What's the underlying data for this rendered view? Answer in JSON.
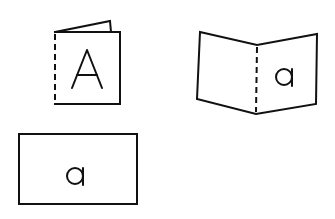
{
  "diagram": {
    "stroke_color": "#111111",
    "background_color": "#ffffff",
    "figures": [
      {
        "id": "closed-booklet",
        "label": "A",
        "fold": "dashed left spine, back page peeking above top edge"
      },
      {
        "id": "open-booklet",
        "label": "a",
        "fold": "dashed center spine, two panels angled like open book"
      },
      {
        "id": "flat-sheet",
        "label": "a",
        "fold": "none, landscape rectangle"
      }
    ]
  }
}
